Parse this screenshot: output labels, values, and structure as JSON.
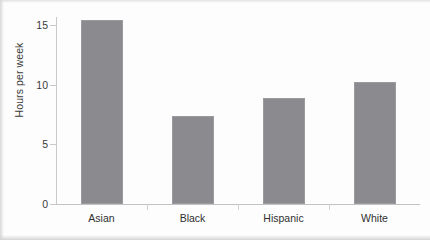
{
  "chart_data": {
    "type": "bar",
    "title": "",
    "xlabel": "",
    "ylabel": "Hours per week",
    "categories": [
      "Asian",
      "Black",
      "Hispanic",
      "White"
    ],
    "values": [
      15.4,
      7.4,
      8.9,
      10.2
    ],
    "ylim": [
      0,
      15.4
    ],
    "yticks": [
      0,
      5,
      10,
      15
    ],
    "ytick_labels": [
      "0",
      "5",
      "10",
      "15"
    ],
    "grid": false,
    "legend": null,
    "bar_color": "#8b8b8f",
    "axis_color": "#c9c9c9",
    "text_color": "#333333"
  }
}
